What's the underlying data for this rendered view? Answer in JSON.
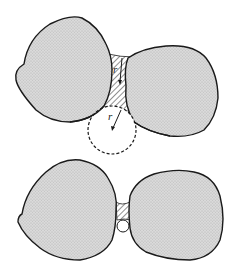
{
  "figure": {
    "top_panel": {
      "description": "Two particles with large pendular liquid bridge and inscribed circle",
      "labels": {
        "neck_radius": "r",
        "circle_radius": "r"
      }
    },
    "bottom_panel": {
      "description": "Two particles with small liquid bridge and small circle"
    },
    "colors": {
      "particle_fill": "#d6d6d6",
      "outline": "#1a1a1a",
      "hatch": "#333333",
      "background": "#ffffff"
    }
  }
}
